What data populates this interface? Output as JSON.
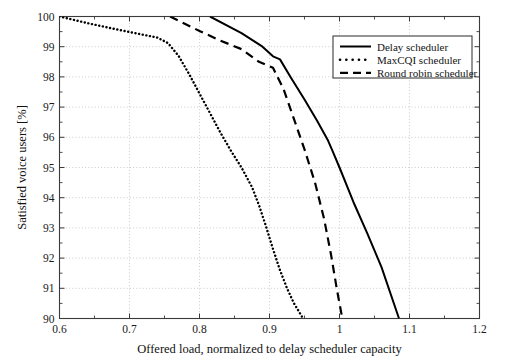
{
  "chart_data": {
    "type": "line",
    "title": "",
    "subtitle": "",
    "xlabel": "Offered load, normalized to delay scheduler capacity",
    "ylabel": "Satisfied voice users [%]",
    "xlim": [
      0.6,
      1.2
    ],
    "ylim": [
      90,
      100
    ],
    "xticks": [
      0.6,
      0.7,
      0.8,
      0.9,
      1.0,
      1.1,
      1.2
    ],
    "xtick_labels": [
      "0.6",
      "0.7",
      "0.8",
      "0.9",
      "1",
      "1.1",
      "1.2"
    ],
    "yticks": [
      90,
      91,
      92,
      93,
      94,
      95,
      96,
      97,
      98,
      99,
      100
    ],
    "ytick_labels": [
      "90",
      "91",
      "92",
      "93",
      "94",
      "95",
      "96",
      "97",
      "98",
      "99",
      "100"
    ],
    "grid": true,
    "grid_style": "dotted",
    "legend_position": "top-right",
    "series": [
      {
        "name": "Delay scheduler",
        "style": "solid",
        "color": "#000000",
        "points": [
          [
            0.815,
            100.0
          ],
          [
            0.86,
            99.45
          ],
          [
            0.89,
            99.0
          ],
          [
            0.905,
            98.68
          ],
          [
            0.915,
            98.58
          ],
          [
            0.93,
            98.0
          ],
          [
            0.95,
            97.25
          ],
          [
            0.968,
            96.55
          ],
          [
            0.983,
            95.92
          ],
          [
            0.99,
            95.55
          ],
          [
            1.0,
            95.0
          ],
          [
            1.02,
            93.85
          ],
          [
            1.04,
            92.8
          ],
          [
            1.06,
            91.7
          ],
          [
            1.085,
            90.0
          ]
        ]
      },
      {
        "name": "MaxCQI scheduler",
        "style": "dotted",
        "color": "#000000",
        "points": [
          [
            0.6,
            100.0
          ],
          [
            0.64,
            99.78
          ],
          [
            0.68,
            99.58
          ],
          [
            0.71,
            99.44
          ],
          [
            0.74,
            99.3
          ],
          [
            0.755,
            99.12
          ],
          [
            0.77,
            98.7
          ],
          [
            0.785,
            98.1
          ],
          [
            0.8,
            97.45
          ],
          [
            0.815,
            96.8
          ],
          [
            0.83,
            96.15
          ],
          [
            0.845,
            95.55
          ],
          [
            0.86,
            95.0
          ],
          [
            0.875,
            94.35
          ],
          [
            0.885,
            93.75
          ],
          [
            0.895,
            93.05
          ],
          [
            0.905,
            92.3
          ],
          [
            0.915,
            91.6
          ],
          [
            0.925,
            91.0
          ],
          [
            0.935,
            90.5
          ],
          [
            0.948,
            90.0
          ]
        ]
      },
      {
        "name": "Round robin scheduler",
        "style": "dashed",
        "color": "#000000",
        "points": [
          [
            0.758,
            100.0
          ],
          [
            0.8,
            99.52
          ],
          [
            0.83,
            99.2
          ],
          [
            0.86,
            98.92
          ],
          [
            0.885,
            98.5
          ],
          [
            0.905,
            98.3
          ],
          [
            0.92,
            97.6
          ],
          [
            0.935,
            96.6
          ],
          [
            0.95,
            95.6
          ],
          [
            0.965,
            94.5
          ],
          [
            0.978,
            93.3
          ],
          [
            0.988,
            92.1
          ],
          [
            0.996,
            91.0
          ],
          [
            1.004,
            90.0
          ]
        ]
      }
    ]
  },
  "legend": {
    "entries": [
      {
        "label": "Delay scheduler",
        "style": "solid"
      },
      {
        "label": "MaxCQI scheduler",
        "style": "dotted"
      },
      {
        "label": "Round robin scheduler",
        "style": "dashed"
      }
    ]
  }
}
